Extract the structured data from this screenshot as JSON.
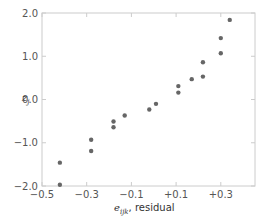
{
  "chart_data": {
    "type": "scatter",
    "title": "",
    "xlabel_symbol": "e",
    "xlabel_subscript": "ijk",
    "xlabel_suffix": ", residual",
    "xlabel": "e_ijk, residual",
    "ylabel_symbol": "z",
    "ylabel_subscript": "j",
    "ylabel": "z_j",
    "xlim": [
      -0.5,
      0.45
    ],
    "ylim": [
      -2.0,
      2.0
    ],
    "x_ticks": [
      -0.5,
      -0.3,
      -0.1,
      0.1,
      0.3
    ],
    "x_tick_labels": [
      "−0.5",
      "−0.3",
      "−0.1",
      "+0.1",
      "+0.3"
    ],
    "y_ticks": [
      2.0,
      1.0,
      0.0,
      -1.0,
      -2.0
    ],
    "y_tick_labels": [
      "2.0",
      "1.0",
      "0.0",
      "−1.0",
      "−2.0"
    ],
    "grid": false,
    "legend": null,
    "point_color": "#666666",
    "axis_color": "#cccccc",
    "points": [
      {
        "x": -0.42,
        "y": -1.97
      },
      {
        "x": -0.42,
        "y": -1.46
      },
      {
        "x": -0.28,
        "y": -1.19
      },
      {
        "x": -0.28,
        "y": -0.93
      },
      {
        "x": -0.18,
        "y": -0.64
      },
      {
        "x": -0.18,
        "y": -0.51
      },
      {
        "x": -0.13,
        "y": -0.37
      },
      {
        "x": -0.02,
        "y": -0.23
      },
      {
        "x": 0.01,
        "y": -0.1
      },
      {
        "x": 0.11,
        "y": 0.16
      },
      {
        "x": 0.11,
        "y": 0.31
      },
      {
        "x": 0.17,
        "y": 0.47
      },
      {
        "x": 0.22,
        "y": 0.53
      },
      {
        "x": 0.22,
        "y": 0.86
      },
      {
        "x": 0.3,
        "y": 1.07
      },
      {
        "x": 0.3,
        "y": 1.42
      },
      {
        "x": 0.34,
        "y": 1.84
      }
    ]
  }
}
